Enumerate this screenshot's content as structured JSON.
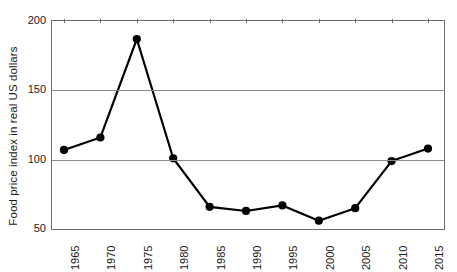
{
  "chart_data": {
    "type": "line",
    "title": "",
    "xlabel": "",
    "ylabel": "Food price index in real US dollars",
    "categories": [
      "1965",
      "1970",
      "1975",
      "1980",
      "1985",
      "1990",
      "1995",
      "2000",
      "2005",
      "2010",
      "2015"
    ],
    "values": [
      107,
      116,
      187,
      101,
      66,
      63,
      67,
      56,
      65,
      99,
      108
    ],
    "series": [
      {
        "name": "Food price index in real US dollars",
        "values": [
          107,
          116,
          187,
          101,
          66,
          63,
          67,
          56,
          65,
          99,
          108
        ]
      }
    ],
    "ylim": [
      50,
      200
    ],
    "yticks": [
      "50",
      "100",
      "150",
      "200"
    ],
    "ytick_values": [
      50,
      100,
      150,
      200
    ],
    "xticks": [
      "1965",
      "1970",
      "1975",
      "1980",
      "1985",
      "1990",
      "1995",
      "2000",
      "2005",
      "2010",
      "2015"
    ],
    "grid": "horizontal",
    "gridlines_at": [
      100,
      150
    ],
    "legend": "none",
    "legend_position": "none",
    "marker": "filled-circle",
    "line_color": "#000000",
    "marker_color": "#000000",
    "grid_color": "#8a8a8a",
    "axis_color": "#6d6d6d",
    "background_color": "#ffffff",
    "xtick_rotation": 90,
    "annotations": []
  }
}
